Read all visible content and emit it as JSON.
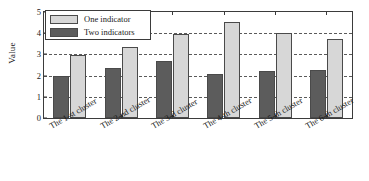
{
  "chart_data": {
    "type": "bar",
    "title": "",
    "xlabel": "",
    "ylabel": "Value",
    "ylim": [
      0,
      5
    ],
    "yticks": [
      0,
      1,
      2,
      3,
      4,
      5
    ],
    "grid": true,
    "legend_position": "upper-left",
    "categories": [
      "The 1-st cluster",
      "The 2-nd cluster",
      "The 3-d cluster",
      "The 4-th cluster",
      "The 5-th cluster",
      "The 6-th cluster"
    ],
    "series": [
      {
        "name": "Two indicators",
        "color": "#5c5c5c",
        "values": [
          2.0,
          2.38,
          2.68,
          2.08,
          2.23,
          2.27
        ]
      },
      {
        "name": "One indicator",
        "color": "#d7d7d7",
        "values": [
          2.95,
          3.37,
          3.95,
          4.52,
          4.0,
          3.75
        ]
      }
    ]
  },
  "legend": {
    "items": [
      {
        "label": "One indicator",
        "swatch": "one"
      },
      {
        "label": "Two indicators",
        "swatch": "two"
      }
    ]
  },
  "axes": {
    "y_title": "Value",
    "y_tick_labels": [
      "0",
      "1",
      "2",
      "3",
      "4",
      "5"
    ],
    "x_tick_labels": [
      "The 1-st cluster",
      "The 2-nd cluster",
      "The 3-d cluster",
      "The 4-th cluster",
      "The 5-th cluster",
      "The 6-th cluster"
    ]
  }
}
